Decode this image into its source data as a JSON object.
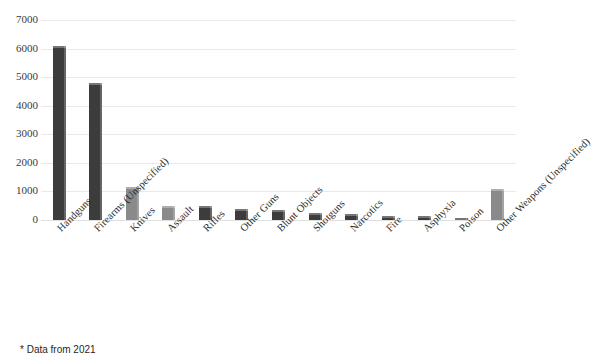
{
  "title_partial": "",
  "footnote": "* Data from 2021",
  "chart_data": {
    "type": "bar",
    "title": "",
    "xlabel": "",
    "ylabel": "",
    "ylim": [
      0,
      7000
    ],
    "ytick_step": 1000,
    "yticks": [
      "7000",
      "6000",
      "5000",
      "4000",
      "3000",
      "2000",
      "1000",
      "0"
    ],
    "grid": true,
    "legend": "none",
    "bar_color": "#3c3c3c",
    "bar_color_light": "#8a8a8a",
    "categories": [
      "Handguns",
      "Firearms (Unspecified)",
      "Knives",
      "Assault",
      "Rifles",
      "Other Guns",
      "Blunt Objects",
      "Shotguns",
      "Narcotics",
      "Fire",
      "Asphyxia",
      "Poison",
      "Other Weapons (Unspecified)"
    ],
    "values": [
      6100,
      4800,
      1150,
      480,
      480,
      380,
      350,
      260,
      200,
      150,
      140,
      60,
      1100
    ],
    "bar_shades": [
      "dark",
      "dark",
      "light",
      "light",
      "dark",
      "dark",
      "dark",
      "dark",
      "dark",
      "dark",
      "dark",
      "dark",
      "light"
    ]
  }
}
